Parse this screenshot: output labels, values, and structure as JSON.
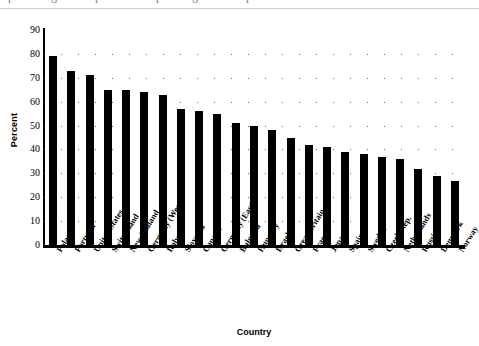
{
  "header": {
    "cropped_title": "percentage of respondents expressing national pride",
    "divider": true
  },
  "axis": {
    "y_title": "Percent",
    "x_title": "Country"
  },
  "chart_data": {
    "type": "bar",
    "title": "",
    "xlabel": "Country",
    "ylabel": "Percent",
    "ylim": [
      0,
      90
    ],
    "ytick_step": 10,
    "yticks": [
      0,
      10,
      20,
      30,
      40,
      50,
      60,
      70,
      80,
      90
    ],
    "grid": "horizontal-dotted",
    "legend": "none",
    "bar_color": "#000000",
    "categories": [
      "Poland",
      "Portugal",
      "United States",
      "Switzerland",
      "New Zealand",
      "Germany (West)",
      "Italy",
      "Slovenia",
      "Canada",
      "Germany (East)",
      "Bulgaria",
      "Hungary",
      "Israel",
      "Great Britain",
      "France",
      "Japan",
      "Spain",
      "Sweden",
      "Czech Rep.",
      "Netherlands",
      "Russia",
      "Denmark",
      "Norway"
    ],
    "values": [
      79,
      73,
      71,
      65,
      65,
      64,
      63,
      57,
      56,
      55,
      51,
      50,
      48,
      45,
      42,
      41,
      39,
      38,
      37,
      36,
      32,
      29,
      27
    ]
  }
}
